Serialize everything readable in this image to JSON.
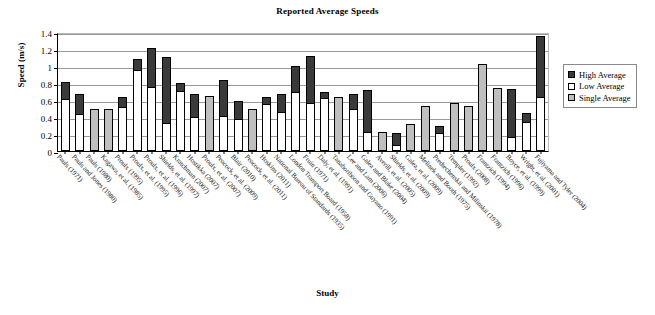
{
  "chart_data": {
    "type": "bar",
    "title": "Reported Average Speeds",
    "xlabel": "Study",
    "ylabel": "Speed (m/s)",
    "ylim": [
      0,
      1.4
    ],
    "yticks": [
      0,
      0.2,
      0.4,
      0.6,
      0.8,
      1,
      1.2,
      1.4
    ],
    "ytick_labels": [
      "0",
      "0.2",
      "0.4",
      "0.6",
      "0.8",
      "1",
      "1.2",
      "1.4"
    ],
    "grid": true,
    "legend_position": "right",
    "stacked": true,
    "series": [
      {
        "name": "High Average",
        "color": "#3a3a3a"
      },
      {
        "name": "Low Average",
        "color": "#ffffff"
      },
      {
        "name": "Single Average",
        "color": "#bfbfbf"
      }
    ],
    "categories": [
      "Pauls (1971)",
      "Pauls and Jones (1980)",
      "Pauls (1980)",
      "Kagawa, et al. (1985)",
      "Proulx (1995)",
      "Proulx, et al. (1995)",
      "Proulx, et al. (1996)",
      "Shields, et al. (1997)",
      "Kratchman (2007)",
      "Hostikka (2007)",
      "Proulx, et al. (2007)",
      "Peacock, et al. (2009)",
      "Blair (2010)",
      "Peacock, et al. (2011)",
      "Hoskins (2011)",
      "National Bureau of Standards (1935)",
      "London Transport Board (1958)",
      "Fruin (1971)",
      "Daly, et al. (1991)",
      "Tanaboriboon and Guyano (1991)",
      "Lee and Lam (2006)",
      "Galea and Blake (2004)",
      "Averill, et al. (2005)",
      "Shields, et al. (2009)",
      "Galea, et al. (2009)",
      "Melinek and Booth (1975)",
      "Predtechenskii and Milinskii (1978)",
      "Templer (1992)",
      "Proulx (2008)",
      "Frantzich (1994)",
      "Frantzich (1996)",
      "Boyce, et al. (1999)",
      "Wright, et al. (2001)",
      "Fujiyama and Tyler (2004)"
    ],
    "data": [
      {
        "study": "Pauls (1971)",
        "low": 0.61,
        "high": 0.81,
        "single": null
      },
      {
        "study": "Pauls and Jones (1980)",
        "low": 0.43,
        "high": 0.67,
        "single": null
      },
      {
        "study": "Pauls (1980)",
        "low": null,
        "high": null,
        "single": 0.5
      },
      {
        "study": "Kagawa, et al. (1985)",
        "low": null,
        "high": null,
        "single": 0.5
      },
      {
        "study": "Proulx (1995)",
        "low": 0.52,
        "high": 0.63,
        "single": null
      },
      {
        "study": "Proulx, et al. (1995)",
        "low": 0.95,
        "high": 1.08,
        "single": null
      },
      {
        "study": "Proulx, et al. (1996)",
        "low": 0.75,
        "high": 1.21,
        "single": null
      },
      {
        "study": "Shields, et al. (1997)",
        "low": 0.33,
        "high": 1.11,
        "single": null
      },
      {
        "study": "Kratchman (2007)",
        "low": 0.71,
        "high": 0.8,
        "single": null
      },
      {
        "study": "Hostikka (2007)",
        "low": 0.4,
        "high": 0.67,
        "single": null
      },
      {
        "study": "Proulx, et al. (2007)",
        "low": null,
        "high": null,
        "single": 0.65
      },
      {
        "study": "Peacock, et al. (2009)",
        "low": 0.41,
        "high": 0.84,
        "single": null
      },
      {
        "study": "Blair (2010)",
        "low": 0.38,
        "high": 0.59,
        "single": null
      },
      {
        "study": "Peacock, et al. (2011)",
        "low": null,
        "high": null,
        "single": 0.49
      },
      {
        "study": "Hoskins (2011)",
        "low": 0.55,
        "high": 0.63,
        "single": null
      },
      {
        "study": "National Bureau of Standards (1935)",
        "low": 0.46,
        "high": 0.67,
        "single": null
      },
      {
        "study": "London Transport Board (1958)",
        "low": 0.69,
        "high": 1.0,
        "single": null
      },
      {
        "study": "Fruin (1971)",
        "low": 0.57,
        "high": 1.12,
        "single": null
      },
      {
        "study": "Daly, et al. (1991)",
        "low": 0.62,
        "high": 0.69,
        "single": null
      },
      {
        "study": "Tanaboriboon and Guyano (1991)",
        "low": null,
        "high": null,
        "single": 0.63
      },
      {
        "study": "Lee and Lam (2006)",
        "low": 0.5,
        "high": 0.67,
        "single": null
      },
      {
        "study": "Galea and Blake (2004)",
        "low": 0.22,
        "high": 0.72,
        "single": null
      },
      {
        "study": "Averill, et al. (2005)",
        "low": null,
        "high": null,
        "single": 0.22
      },
      {
        "study": "Shields, et al. (2009)",
        "low": 0.07,
        "high": 0.21,
        "single": null
      },
      {
        "study": "Galea, et al. (2009)",
        "low": null,
        "high": null,
        "single": 0.32
      },
      {
        "study": "Melinek and Booth (1975)",
        "low": null,
        "high": null,
        "single": 0.53
      },
      {
        "study": "Predtechenskii and Milinskii (1978)",
        "low": 0.21,
        "high": 0.3,
        "single": null
      },
      {
        "study": "Templer (1992)",
        "low": null,
        "high": null,
        "single": 0.56
      },
      {
        "study": "Proulx (2008)",
        "low": null,
        "high": null,
        "single": 0.53
      },
      {
        "study": "Frantzich (1994)",
        "low": null,
        "high": null,
        "single": 1.02
      },
      {
        "study": "Frantzich (1996)",
        "low": null,
        "high": null,
        "single": 0.74
      },
      {
        "study": "Boyce, et al. (1999)",
        "low": 0.16,
        "high": 0.73,
        "single": null
      },
      {
        "study": "Wright, et al. (2001)",
        "low": 0.34,
        "high": 0.45,
        "single": null
      },
      {
        "study": "Fujiyama and Tyler (2004)",
        "low": 0.64,
        "high": 1.35,
        "single": null
      }
    ]
  },
  "legend": {
    "items": [
      {
        "label": "High Average",
        "swatch": "sw-high"
      },
      {
        "label": "Low Average",
        "swatch": "sw-low"
      },
      {
        "label": "Single Average",
        "swatch": "sw-single"
      }
    ]
  }
}
